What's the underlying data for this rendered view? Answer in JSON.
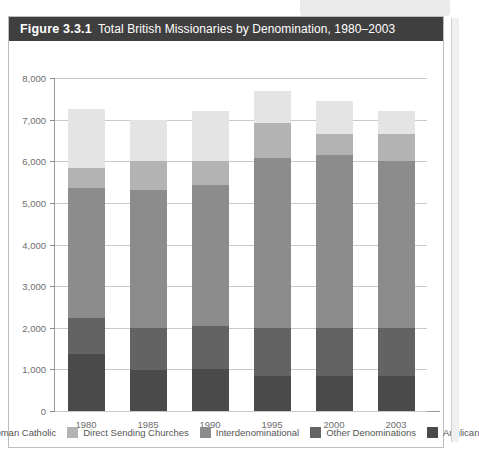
{
  "figure": {
    "number": "Figure 3.3.1",
    "title": "Total British Missionaries by Denomination, 1980–2003"
  },
  "colors": {
    "title_bar": "#3f3f3f",
    "roman_catholic": "#e4e4e4",
    "direct_sending_churches": "#b3b3b3",
    "interdenominational": "#8c8c8c",
    "other_denominations": "#636363",
    "anglican": "#4a4a4a",
    "gridline": "#c9c9c9",
    "axis": "#9a9a9a",
    "tick_text": "#6d6d6d"
  },
  "axis": {
    "y_ticks": [
      "8,000",
      "7,000",
      "6,000",
      "5,000",
      "4,000",
      "3,000",
      "2,000",
      "1,000",
      "0"
    ],
    "x_ticks": [
      "1980",
      "1985",
      "1990",
      "1995",
      "2000",
      "2003"
    ]
  },
  "legend": {
    "items": [
      {
        "label": "Roman Catholic",
        "color": "#e4e4e4"
      },
      {
        "label": "Direct Sending Churches",
        "color": "#b3b3b3"
      },
      {
        "label": "Interdenominational",
        "color": "#8c8c8c"
      },
      {
        "label": "Other Denominations",
        "color": "#636363"
      },
      {
        "label": "Anglican",
        "color": "#4a4a4a"
      }
    ]
  },
  "chart_data": {
    "type": "bar",
    "stacked": true,
    "title": "Total British Missionaries by Denomination, 1980–2003",
    "xlabel": "",
    "ylabel": "",
    "ylim": [
      0,
      8000
    ],
    "ytick_step": 1000,
    "grid": true,
    "legend_position": "bottom",
    "categories": [
      "1980",
      "1985",
      "1990",
      "1995",
      "2000",
      "2003"
    ],
    "series": [
      {
        "name": "Anglican",
        "color": "#4a4a4a",
        "values": [
          1370,
          985,
          1000,
          840,
          840,
          840
        ]
      },
      {
        "name": "Other Denominations",
        "color": "#636363",
        "values": [
          870,
          1005,
          1050,
          1160,
          1160,
          1160
        ]
      },
      {
        "name": "Interdenominational",
        "color": "#8c8c8c",
        "values": [
          3110,
          3330,
          3390,
          4080,
          4150,
          4000
        ]
      },
      {
        "name": "Direct Sending Churches",
        "color": "#b3b3b3",
        "values": [
          500,
          680,
          560,
          840,
          510,
          660
        ]
      },
      {
        "name": "Roman Catholic",
        "color": "#e4e4e4",
        "values": [
          1400,
          1000,
          1200,
          770,
          790,
          540
        ]
      }
    ],
    "totals": [
      7250,
      7000,
      7200,
      7690,
      7450,
      7200
    ]
  }
}
